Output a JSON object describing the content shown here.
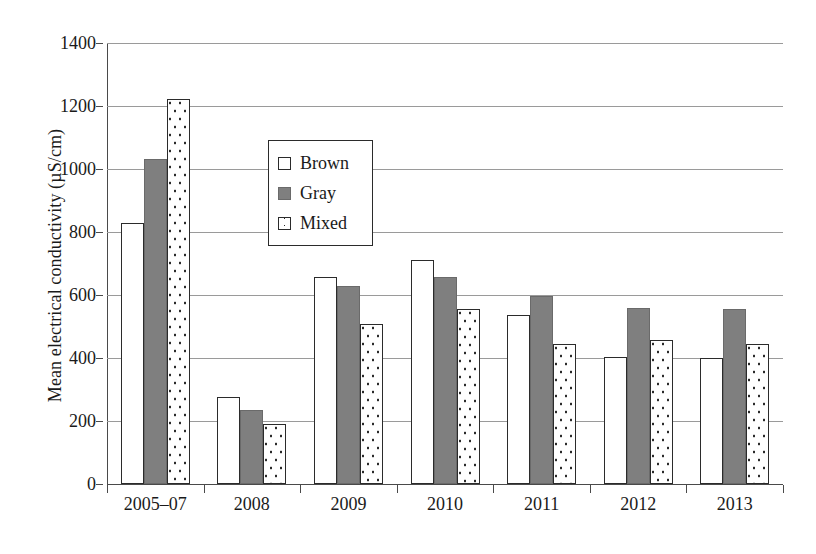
{
  "chart_data": {
    "type": "bar",
    "title": "",
    "subtitle": "",
    "xlabel": "",
    "ylabel": "Mean electrical conductivity (µS/cm)",
    "categories": [
      "2005–07",
      "2008",
      "2009",
      "2010",
      "2011",
      "2012",
      "2013"
    ],
    "series": [
      {
        "name": "Brown",
        "fill": "open",
        "values": [
          828,
          275,
          657,
          710,
          535,
          403,
          400
        ]
      },
      {
        "name": "Gray",
        "fill": "solid",
        "values": [
          1032,
          235,
          628,
          657,
          597,
          560,
          556
        ]
      },
      {
        "name": "Mixed",
        "fill": "dotted",
        "values": [
          1222,
          192,
          507,
          555,
          445,
          458,
          445
        ]
      }
    ],
    "ylim": [
      0,
      1400
    ],
    "yticks": [
      0,
      200,
      400,
      600,
      800,
      1000,
      1200,
      1400
    ],
    "ytick_labels": [
      "0",
      "200",
      "400",
      "600",
      "800",
      "1000",
      "1200",
      "1400"
    ],
    "grid": true,
    "grid_axis": "y",
    "legend_position": "upper-center-left",
    "colors": {
      "open_fill": "#ffffff",
      "solid_fill": "#7f7f7f",
      "dotted_fill": "#ffffff",
      "outline": "#2b2b2b",
      "gridline": "#9a9a9a",
      "axis": "#4a4a4a",
      "text": "#1a1a1a",
      "background": "#ffffff"
    }
  },
  "legend": {
    "items": [
      {
        "label": "Brown",
        "swatch": "open-square-swatch"
      },
      {
        "label": "Gray",
        "swatch": "solid-square-swatch"
      },
      {
        "label": "Mixed",
        "swatch": "dotted-square-swatch"
      }
    ]
  }
}
